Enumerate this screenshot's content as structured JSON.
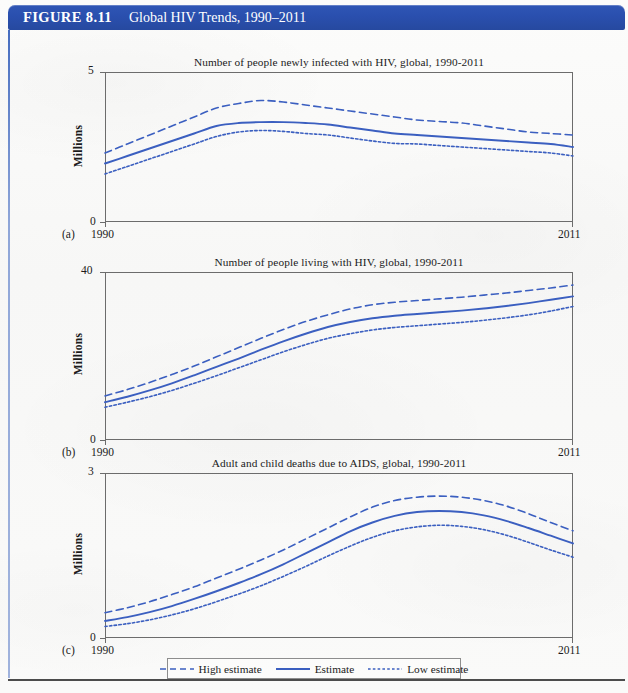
{
  "figure": {
    "number_label": "FIGURE 8.11",
    "title": "Global HIV Trends, 1990–2011"
  },
  "colors": {
    "banner_blue": "#2a4fae",
    "line_blue": "#3b5fc0",
    "frame_gray": "#6c6c6c",
    "page_bg": "#fbfbfa"
  },
  "legend": {
    "items": [
      {
        "label": "High estimate",
        "style": "dashed",
        "name": "legend-high-estimate"
      },
      {
        "label": "Estimate",
        "style": "solid",
        "name": "legend-estimate"
      },
      {
        "label": "Low estimate",
        "style": "dotted",
        "name": "legend-low-estimate"
      }
    ]
  },
  "panels": [
    {
      "letter": "(a)",
      "title": "Number of people newly infected with HIV, global, 1990-2011",
      "ylabel": "Millions",
      "ymax_label": "5",
      "ymin_label": "0",
      "xstart_label": "1990",
      "xend_label": "2011"
    },
    {
      "letter": "(b)",
      "title": "Number of people living with HIV, global, 1990-2011",
      "ylabel": "Millions",
      "ymax_label": "40",
      "ymin_label": "0",
      "xstart_label": "1990",
      "xend_label": "2011"
    },
    {
      "letter": "(c)",
      "title": "Adult and child deaths due to AIDS, global, 1990-2011",
      "ylabel": "Millions",
      "ymax_label": "3",
      "ymin_label": "0",
      "xstart_label": "1990",
      "xend_label": "2011"
    }
  ],
  "chart_data": [
    {
      "type": "line",
      "panel": "(a)",
      "title": "Number of people newly infected with HIV, global, 1990-2011",
      "xlabel": "",
      "ylabel": "Millions",
      "xlim": [
        1990,
        2011
      ],
      "ylim": [
        0,
        5
      ],
      "yticks": [
        0,
        5
      ],
      "xticks": [
        1990,
        2011
      ],
      "grid": false,
      "legend_position": "below-figure",
      "x": [
        1990,
        1991,
        1992,
        1993,
        1994,
        1995,
        1996,
        1997,
        1998,
        1999,
        2000,
        2001,
        2002,
        2003,
        2004,
        2005,
        2006,
        2007,
        2008,
        2009,
        2010,
        2011
      ],
      "series": [
        {
          "name": "High estimate",
          "style": "dashed",
          "values": [
            2.3,
            2.6,
            2.9,
            3.2,
            3.5,
            3.8,
            3.95,
            4.05,
            4.0,
            3.9,
            3.8,
            3.7,
            3.6,
            3.5,
            3.4,
            3.35,
            3.3,
            3.2,
            3.1,
            3.0,
            2.95,
            2.9
          ]
        },
        {
          "name": "Estimate",
          "style": "solid",
          "values": [
            1.95,
            2.2,
            2.45,
            2.7,
            2.95,
            3.2,
            3.3,
            3.33,
            3.33,
            3.3,
            3.25,
            3.15,
            3.05,
            2.95,
            2.9,
            2.85,
            2.8,
            2.75,
            2.7,
            2.65,
            2.6,
            2.5
          ]
        },
        {
          "name": "Low estimate",
          "style": "dotted",
          "values": [
            1.6,
            1.85,
            2.1,
            2.35,
            2.6,
            2.85,
            3.0,
            3.05,
            3.02,
            2.95,
            2.9,
            2.8,
            2.7,
            2.62,
            2.6,
            2.55,
            2.5,
            2.45,
            2.4,
            2.35,
            2.3,
            2.2
          ]
        }
      ]
    },
    {
      "type": "line",
      "panel": "(b)",
      "title": "Number of people living with HIV, global, 1990-2011",
      "xlabel": "",
      "ylabel": "Millions",
      "xlim": [
        1990,
        2011
      ],
      "ylim": [
        0,
        40
      ],
      "yticks": [
        0,
        40
      ],
      "xticks": [
        1990,
        2011
      ],
      "grid": false,
      "legend_position": "below-figure",
      "x": [
        1990,
        1991,
        1992,
        1993,
        1994,
        1995,
        1996,
        1997,
        1998,
        1999,
        2000,
        2001,
        2002,
        2003,
        2004,
        2005,
        2006,
        2007,
        2008,
        2009,
        2010,
        2011
      ],
      "series": [
        {
          "name": "High estimate",
          "style": "dashed",
          "values": [
            10.5,
            12.0,
            13.7,
            15.6,
            17.6,
            19.8,
            22.0,
            24.2,
            26.3,
            28.2,
            29.8,
            31.2,
            32.2,
            32.8,
            33.2,
            33.6,
            34.0,
            34.5,
            35.0,
            35.6,
            36.2,
            36.9
          ]
        },
        {
          "name": "Estimate",
          "style": "solid",
          "values": [
            9.0,
            10.3,
            11.8,
            13.5,
            15.4,
            17.4,
            19.4,
            21.5,
            23.5,
            25.3,
            26.9,
            28.1,
            29.0,
            29.6,
            30.0,
            30.4,
            30.8,
            31.3,
            31.9,
            32.6,
            33.4,
            34.2
          ]
        },
        {
          "name": "Low estimate",
          "style": "dotted",
          "values": [
            7.8,
            9.0,
            10.3,
            11.8,
            13.5,
            15.3,
            17.2,
            19.1,
            21.0,
            22.7,
            24.2,
            25.3,
            26.2,
            26.8,
            27.2,
            27.6,
            28.0,
            28.5,
            29.1,
            29.8,
            30.7,
            31.8
          ]
        }
      ]
    },
    {
      "type": "line",
      "panel": "(c)",
      "title": "Adult and child deaths due to AIDS, global, 1990-2011",
      "xlabel": "",
      "ylabel": "Millions",
      "xlim": [
        1990,
        2011
      ],
      "ylim": [
        0,
        3
      ],
      "yticks": [
        0,
        3
      ],
      "xticks": [
        1990,
        2011
      ],
      "grid": false,
      "legend_position": "below-figure",
      "x": [
        1990,
        1991,
        1992,
        1993,
        1994,
        1995,
        1996,
        1997,
        1998,
        1999,
        2000,
        2001,
        2002,
        2003,
        2004,
        2005,
        2006,
        2007,
        2008,
        2009,
        2010,
        2011
      ],
      "series": [
        {
          "name": "High estimate",
          "style": "dashed",
          "values": [
            0.46,
            0.55,
            0.66,
            0.79,
            0.93,
            1.09,
            1.25,
            1.42,
            1.6,
            1.8,
            2.0,
            2.2,
            2.38,
            2.5,
            2.56,
            2.58,
            2.56,
            2.5,
            2.4,
            2.26,
            2.1,
            1.95
          ]
        },
        {
          "name": "Estimate",
          "style": "solid",
          "values": [
            0.31,
            0.38,
            0.47,
            0.58,
            0.71,
            0.85,
            1.0,
            1.16,
            1.34,
            1.54,
            1.74,
            1.94,
            2.1,
            2.22,
            2.29,
            2.31,
            2.29,
            2.23,
            2.13,
            2.0,
            1.86,
            1.72
          ]
        },
        {
          "name": "Low estimate",
          "style": "dotted",
          "values": [
            0.21,
            0.26,
            0.33,
            0.42,
            0.53,
            0.66,
            0.8,
            0.95,
            1.12,
            1.3,
            1.49,
            1.67,
            1.83,
            1.95,
            2.02,
            2.05,
            2.03,
            1.97,
            1.87,
            1.74,
            1.6,
            1.47
          ]
        }
      ]
    }
  ]
}
